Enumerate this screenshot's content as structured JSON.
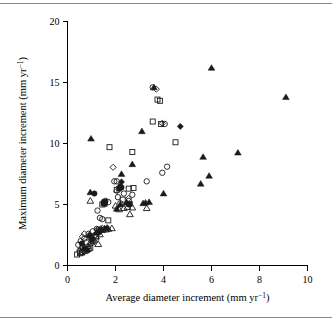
{
  "figure": {
    "background_color": "#ffffff",
    "foreground_color": "#000000",
    "has_top_rule": true,
    "has_bottom_rule": true
  },
  "chart_data": {
    "type": "scatter",
    "title": "",
    "xlabel": "Average diameter increment (mm yr⁻¹)",
    "ylabel": "Maximum diameter increment (mm yr⁻¹)",
    "xlim": [
      0,
      10
    ],
    "ylim": [
      0,
      20
    ],
    "xticks": [
      0,
      2,
      4,
      6,
      8,
      10
    ],
    "yticks": [
      0,
      5,
      10,
      15,
      20
    ],
    "xticklabels": [
      "0",
      "2",
      "4",
      "6",
      "8",
      "10"
    ],
    "yticklabels": [
      "0",
      "5",
      "10",
      "15",
      "20"
    ],
    "grid": false,
    "legend": "none",
    "axis_style": "left-and-bottom-spines",
    "marker_shapes": [
      "open-circle",
      "filled-circle",
      "open-square",
      "filled-square",
      "open-triangle",
      "filled-triangle",
      "open-diamond",
      "filled-diamond"
    ],
    "series": [
      {
        "name": "open-circle",
        "marker": "open-circle",
        "points": [
          [
            0.45,
            1.7
          ],
          [
            0.55,
            2.0
          ],
          [
            0.62,
            1.5
          ],
          [
            0.7,
            2.2
          ],
          [
            0.78,
            1.9
          ],
          [
            0.88,
            2.6
          ],
          [
            0.95,
            2.3
          ],
          [
            1.05,
            2.8
          ],
          [
            1.15,
            2.5
          ],
          [
            1.22,
            3.0
          ],
          [
            1.25,
            4.5
          ],
          [
            1.35,
            3.9
          ],
          [
            1.45,
            3.8
          ],
          [
            1.58,
            5.3
          ],
          [
            1.7,
            5.2
          ],
          [
            1.95,
            6.9
          ],
          [
            2.05,
            6.9
          ],
          [
            2.1,
            5.6
          ],
          [
            2.2,
            5.1
          ],
          [
            2.35,
            5.9
          ],
          [
            2.55,
            5.3
          ],
          [
            2.7,
            5.8
          ],
          [
            3.3,
            6.9
          ],
          [
            3.55,
            14.6
          ],
          [
            3.95,
            7.6
          ],
          [
            4.05,
            11.6
          ],
          [
            4.15,
            8.1
          ],
          [
            0.5,
            1.2
          ],
          [
            0.58,
            1.3
          ],
          [
            1.3,
            2.9
          ]
        ]
      },
      {
        "name": "filled-circle",
        "marker": "filled-circle",
        "points": [
          [
            0.72,
            1.4
          ],
          [
            0.95,
            2.4
          ],
          [
            1.12,
            5.9
          ],
          [
            1.3,
            2.7
          ],
          [
            1.55,
            5.2
          ],
          [
            2.2,
            6.5
          ],
          [
            2.25,
            6.4
          ],
          [
            2.55,
            5.0
          ],
          [
            0.6,
            1.8
          ],
          [
            1.02,
            2.1
          ]
        ]
      },
      {
        "name": "open-square",
        "marker": "open-square",
        "points": [
          [
            0.4,
            0.9
          ],
          [
            0.52,
            1.0
          ],
          [
            0.62,
            1.1
          ],
          [
            0.75,
            1.2
          ],
          [
            0.88,
            1.35
          ],
          [
            1.05,
            2.0
          ],
          [
            1.2,
            2.3
          ],
          [
            1.55,
            5.2
          ],
          [
            1.7,
            3.7
          ],
          [
            1.75,
            9.7
          ],
          [
            2.05,
            6.2
          ],
          [
            2.3,
            5.4
          ],
          [
            2.55,
            6.3
          ],
          [
            2.7,
            9.3
          ],
          [
            2.75,
            6.35
          ],
          [
            3.55,
            11.8
          ],
          [
            3.85,
            13.5
          ],
          [
            3.9,
            11.6
          ],
          [
            4.5,
            10.1
          ],
          [
            3.75,
            13.6
          ],
          [
            1.45,
            5.0
          ],
          [
            0.95,
            1.45
          ]
        ]
      },
      {
        "name": "filled-square",
        "marker": "filled-square",
        "points": [
          [
            0.82,
            1.25
          ],
          [
            1.5,
            5.1
          ],
          [
            1.55,
            5.05
          ],
          [
            2.15,
            6.3
          ],
          [
            2.6,
            5.05
          ]
        ]
      },
      {
        "name": "open-triangle",
        "marker": "open-triangle",
        "points": [
          [
            0.58,
            1.05
          ],
          [
            0.7,
            1.45
          ],
          [
            0.85,
            1.6
          ],
          [
            1.0,
            1.9
          ],
          [
            1.1,
            2.1
          ],
          [
            1.18,
            2.4
          ],
          [
            1.28,
            1.75
          ],
          [
            1.35,
            2.55
          ],
          [
            1.45,
            2.9
          ],
          [
            1.6,
            2.95
          ],
          [
            1.7,
            3.0
          ],
          [
            1.85,
            3.05
          ],
          [
            2.15,
            4.6
          ],
          [
            2.35,
            4.7
          ],
          [
            2.5,
            4.8
          ],
          [
            2.6,
            4.2
          ],
          [
            2.7,
            4.75
          ],
          [
            3.3,
            4.7
          ],
          [
            0.95,
            5.3
          ],
          [
            2.0,
            4.9
          ]
        ]
      },
      {
        "name": "filled-triangle",
        "marker": "filled-triangle",
        "points": [
          [
            0.95,
            6.0
          ],
          [
            0.98,
            10.4
          ],
          [
            1.3,
            2.85
          ],
          [
            1.4,
            2.95
          ],
          [
            1.55,
            3.05
          ],
          [
            2.05,
            4.65
          ],
          [
            2.2,
            5.0
          ],
          [
            2.25,
            7.5
          ],
          [
            2.45,
            5.15
          ],
          [
            2.7,
            8.3
          ],
          [
            3.1,
            11.0
          ],
          [
            3.15,
            5.1
          ],
          [
            3.25,
            5.15
          ],
          [
            3.4,
            5.2
          ],
          [
            3.6,
            14.6
          ],
          [
            4.0,
            5.9
          ],
          [
            5.55,
            6.7
          ],
          [
            5.65,
            8.9
          ],
          [
            5.9,
            7.35
          ],
          [
            6.0,
            16.2
          ],
          [
            7.1,
            9.25
          ],
          [
            9.1,
            13.8
          ],
          [
            1.2,
            2.7
          ],
          [
            1.65,
            3.1
          ],
          [
            0.9,
            2.5
          ]
        ]
      },
      {
        "name": "open-diamond",
        "marker": "open-diamond",
        "points": [
          [
            0.7,
            2.6
          ],
          [
            1.25,
            2.95
          ],
          [
            1.45,
            3.05
          ],
          [
            1.9,
            8.05
          ],
          [
            2.05,
            6.1
          ],
          [
            2.55,
            5.5
          ],
          [
            3.7,
            14.45
          ],
          [
            3.95,
            11.65
          ],
          [
            0.62,
            2.35
          ],
          [
            1.38,
            3.0
          ]
        ]
      },
      {
        "name": "filled-diamond",
        "marker": "filled-diamond",
        "points": [
          [
            2.25,
            6.85
          ],
          [
            4.7,
            11.4
          ]
        ]
      }
    ]
  }
}
